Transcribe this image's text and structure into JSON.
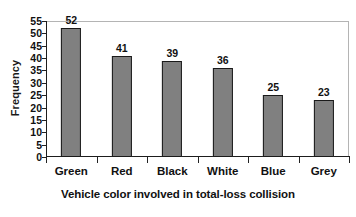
{
  "chart_data": {
    "type": "bar",
    "title": "",
    "categories": [
      "Green",
      "Red",
      "Black",
      "White",
      "Blue",
      "Grey"
    ],
    "values": [
      52,
      41,
      39,
      36,
      25,
      23
    ],
    "series": [
      {
        "name": "Frequency",
        "values": [
          52,
          41,
          39,
          36,
          25,
          23
        ]
      }
    ],
    "data_labels": [
      "52",
      "41",
      "39",
      "36",
      "25",
      "23"
    ],
    "xlabel": "Vehicle color involved in total-loss collision",
    "ylabel": "Frequency",
    "ylim": [
      0,
      55
    ],
    "ytick_step": 5,
    "ytick_labels": [
      "55",
      "50",
      "45",
      "40",
      "35",
      "30",
      "25",
      "20",
      "15",
      "10",
      "5",
      "0"
    ],
    "ytick_values": [
      55,
      50,
      45,
      40,
      35,
      30,
      25,
      20,
      15,
      10,
      5,
      0
    ],
    "grid": false,
    "legend": false,
    "legend_position": "none",
    "bar_fill_color": "#808080",
    "bar_edge_color": "#1a1a1a",
    "plot_border_color": "#b4b4b4",
    "axis_color": "#1d1d1d",
    "text_color": "#111111",
    "background_color": "#ffffff"
  }
}
